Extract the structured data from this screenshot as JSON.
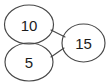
{
  "diagram": {
    "type": "number-bond-graph",
    "background_color": "#ffffff",
    "stroke_color": "#474747",
    "text_color": "#1c1c1c",
    "nodes": [
      {
        "id": "node-10",
        "label": "10",
        "cx": 29,
        "cy": 24.5,
        "rx": 24.5,
        "ry": 19.5
      },
      {
        "id": "node-5",
        "label": "5",
        "cx": 29,
        "cy": 62,
        "rx": 24,
        "ry": 19
      },
      {
        "id": "node-15",
        "label": "15",
        "cx": 83.5,
        "cy": 43,
        "rx": 21.5,
        "ry": 19
      }
    ],
    "edges": [
      {
        "id": "edge-10-15",
        "from": "node-10",
        "to": "node-15",
        "label": "",
        "x1": 51,
        "y1": 30,
        "x2": 65,
        "y2": 37
      },
      {
        "id": "edge-5-15",
        "from": "node-5",
        "to": "node-15",
        "label": "",
        "x1": 51,
        "y1": 57,
        "x2": 64,
        "y2": 48
      }
    ]
  }
}
